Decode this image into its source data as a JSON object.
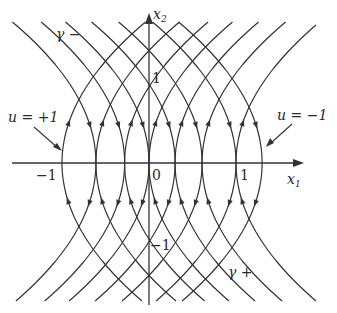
{
  "diagram": {
    "type": "phase-portrait",
    "stroke_color": "#333333",
    "axes": {
      "x_label": "x",
      "x_label_sub": "1",
      "y_label": "x",
      "y_label_sub": "2",
      "origin_label": "0",
      "x_ticks": [
        {
          "value": -1,
          "label": "−1"
        },
        {
          "value": 1,
          "label": "1"
        }
      ],
      "y_ticks": [
        {
          "value": 1,
          "label": "1"
        },
        {
          "value": -1,
          "label": "−1"
        }
      ]
    },
    "annotations": {
      "u_plus": "u = +1",
      "u_minus": "u = −1",
      "gamma_minus": "γ −",
      "gamma_plus": "γ +"
    },
    "families": {
      "u_plus_right_opening_vertices_x1": [
        -1.0,
        -0.61,
        -0.28,
        0.0,
        0.3,
        0.61,
        1.0
      ],
      "u_minus_left_opening_vertices_x1": [
        -0.61,
        -0.28,
        0.0,
        0.3,
        0.61,
        1.0,
        1.3
      ]
    }
  }
}
